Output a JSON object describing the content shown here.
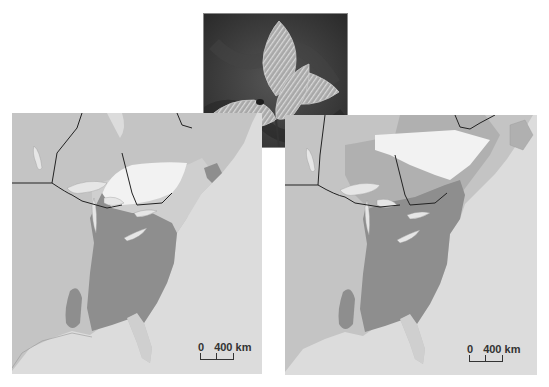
{
  "figure": {
    "photo": {
      "subject": "Beech seedling leaves",
      "description": "Photograph of serrated, parallel-veined leaves on a dark mottled background"
    },
    "maps": [
      {
        "id": "left",
        "label": "Range map (current)",
        "scale_bar": {
          "start": "0",
          "end": "400 km"
        },
        "regions": [
          "dark-range",
          "light-range",
          "white-zone",
          "land",
          "ocean",
          "lakes",
          "borders"
        ]
      },
      {
        "id": "right",
        "label": "Range map (projected)",
        "scale_bar": {
          "start": "0",
          "end": "400 km"
        },
        "regions": [
          "dark-range",
          "medium-range",
          "white-zone",
          "land",
          "ocean",
          "lakes",
          "borders"
        ]
      }
    ],
    "colors": {
      "ocean": "#dcdcdc",
      "land": "#c4c4c4",
      "range_dark": "#8e8e8e",
      "range_medium": "#b0b0b0",
      "range_light": "#cfcfcf",
      "white_zone": "#f2f2f2",
      "lakes": "#e6e6e6",
      "border": "#222222"
    }
  }
}
